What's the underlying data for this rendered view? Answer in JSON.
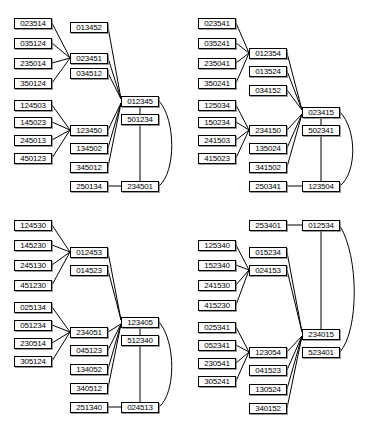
{
  "figure": {
    "type": "permutation-lattice-diagram",
    "panel_count": 4,
    "stroke_color": "#000000",
    "node_fill": "#ffffff",
    "node_text_color": "#000000"
  },
  "panels": [
    {
      "id": "panel-top-left",
      "nodes": [
        {
          "id": "tl-n0",
          "label": "023514",
          "x": 14,
          "y": 18
        },
        {
          "id": "tl-n1",
          "label": "035124",
          "x": 14,
          "y": 38
        },
        {
          "id": "tl-n2",
          "label": "235014",
          "x": 14,
          "y": 58
        },
        {
          "id": "tl-n3",
          "label": "350124",
          "x": 14,
          "y": 78
        },
        {
          "id": "tl-n4",
          "label": "124503",
          "x": 14,
          "y": 100
        },
        {
          "id": "tl-n5",
          "label": "145023",
          "x": 14,
          "y": 117
        },
        {
          "id": "tl-n6",
          "label": "245013",
          "x": 14,
          "y": 135
        },
        {
          "id": "tl-n7",
          "label": "450123",
          "x": 14,
          "y": 153
        },
        {
          "id": "tl-n8",
          "label": "013452",
          "x": 70,
          "y": 22
        },
        {
          "id": "tl-n9",
          "label": "023451",
          "x": 70,
          "y": 53
        },
        {
          "id": "tl-n10",
          "label": "034512",
          "x": 70,
          "y": 68
        },
        {
          "id": "tl-n11",
          "label": "123450",
          "x": 70,
          "y": 125
        },
        {
          "id": "tl-n12",
          "label": "134502",
          "x": 70,
          "y": 143
        },
        {
          "id": "tl-n13",
          "label": "345012",
          "x": 70,
          "y": 162
        },
        {
          "id": "tl-n14",
          "label": "250134",
          "x": 70,
          "y": 181
        },
        {
          "id": "tl-n15",
          "label": "012345",
          "x": 121,
          "y": 96
        },
        {
          "id": "tl-n16",
          "label": "501234",
          "x": 121,
          "y": 114
        },
        {
          "id": "tl-n17",
          "label": "234501",
          "x": 121,
          "y": 181
        }
      ]
    },
    {
      "id": "panel-top-right",
      "nodes": [
        {
          "id": "tr-n0",
          "label": "023541",
          "x": 14,
          "y": 18
        },
        {
          "id": "tr-n1",
          "label": "035241",
          "x": 14,
          "y": 38
        },
        {
          "id": "tr-n2",
          "label": "235041",
          "x": 14,
          "y": 58
        },
        {
          "id": "tr-n3",
          "label": "350241",
          "x": 14,
          "y": 78
        },
        {
          "id": "tr-n4",
          "label": "125034",
          "x": 14,
          "y": 100
        },
        {
          "id": "tr-n5",
          "label": "150234",
          "x": 14,
          "y": 117
        },
        {
          "id": "tr-n6",
          "label": "241503",
          "x": 14,
          "y": 135
        },
        {
          "id": "tr-n7",
          "label": "415023",
          "x": 14,
          "y": 153
        },
        {
          "id": "tr-n8",
          "label": "012354",
          "x": 65,
          "y": 48
        },
        {
          "id": "tr-n9",
          "label": "013524",
          "x": 65,
          "y": 66
        },
        {
          "id": "tr-n10",
          "label": "034152",
          "x": 65,
          "y": 85
        },
        {
          "id": "tr-n11",
          "label": "234150",
          "x": 65,
          "y": 125
        },
        {
          "id": "tr-n12",
          "label": "135024",
          "x": 65,
          "y": 143
        },
        {
          "id": "tr-n13",
          "label": "341502",
          "x": 65,
          "y": 162
        },
        {
          "id": "tr-n14",
          "label": "250341",
          "x": 65,
          "y": 181
        },
        {
          "id": "tr-n15",
          "label": "023415",
          "x": 118,
          "y": 107
        },
        {
          "id": "tr-n16",
          "label": "502341",
          "x": 118,
          "y": 125
        },
        {
          "id": "tr-n17",
          "label": "123504",
          "x": 118,
          "y": 181
        }
      ]
    },
    {
      "id": "panel-bottom-left",
      "nodes": [
        {
          "id": "bl-n0",
          "label": "124530",
          "x": 14,
          "y": 8
        },
        {
          "id": "bl-n1",
          "label": "145230",
          "x": 14,
          "y": 28
        },
        {
          "id": "bl-n2",
          "label": "245130",
          "x": 14,
          "y": 48
        },
        {
          "id": "bl-n3",
          "label": "451230",
          "x": 14,
          "y": 68
        },
        {
          "id": "bl-n4",
          "label": "025134",
          "x": 14,
          "y": 90
        },
        {
          "id": "bl-n5",
          "label": "051234",
          "x": 14,
          "y": 108
        },
        {
          "id": "bl-n6",
          "label": "230514",
          "x": 14,
          "y": 126
        },
        {
          "id": "bl-n7",
          "label": "305124",
          "x": 14,
          "y": 144
        },
        {
          "id": "bl-n8",
          "label": "012453",
          "x": 70,
          "y": 35
        },
        {
          "id": "bl-n9",
          "label": "014523",
          "x": 70,
          "y": 53
        },
        {
          "id": "bl-n10",
          "label": "234051",
          "x": 70,
          "y": 115
        },
        {
          "id": "bl-n11",
          "label": "045123",
          "x": 70,
          "y": 133
        },
        {
          "id": "bl-n12",
          "label": "134052",
          "x": 70,
          "y": 152
        },
        {
          "id": "bl-n13",
          "label": "340512",
          "x": 70,
          "y": 171
        },
        {
          "id": "bl-n14",
          "label": "251340",
          "x": 70,
          "y": 190
        },
        {
          "id": "bl-n15",
          "label": "123405",
          "x": 121,
          "y": 105
        },
        {
          "id": "bl-n16",
          "label": "512340",
          "x": 121,
          "y": 123
        },
        {
          "id": "bl-n17",
          "label": "024513",
          "x": 121,
          "y": 190
        }
      ]
    },
    {
      "id": "panel-bottom-right",
      "nodes": [
        {
          "id": "br-n0",
          "label": "125340",
          "x": 14,
          "y": 28
        },
        {
          "id": "br-n1",
          "label": "152340",
          "x": 14,
          "y": 48
        },
        {
          "id": "br-n2",
          "label": "241530",
          "x": 14,
          "y": 68
        },
        {
          "id": "br-n3",
          "label": "415230",
          "x": 14,
          "y": 88
        },
        {
          "id": "br-n4",
          "label": "025341",
          "x": 14,
          "y": 110
        },
        {
          "id": "br-n5",
          "label": "052341",
          "x": 14,
          "y": 128
        },
        {
          "id": "br-n6",
          "label": "230541",
          "x": 14,
          "y": 146
        },
        {
          "id": "br-n7",
          "label": "305241",
          "x": 14,
          "y": 164
        },
        {
          "id": "br-n8",
          "label": "253401",
          "x": 65,
          "y": 8
        },
        {
          "id": "br-n9",
          "label": "015234",
          "x": 65,
          "y": 35
        },
        {
          "id": "br-n10",
          "label": "024153",
          "x": 65,
          "y": 53
        },
        {
          "id": "br-n11",
          "label": "123054",
          "x": 65,
          "y": 135
        },
        {
          "id": "br-n12",
          "label": "041523",
          "x": 65,
          "y": 153
        },
        {
          "id": "br-n13",
          "label": "130524",
          "x": 65,
          "y": 172
        },
        {
          "id": "br-n14",
          "label": "340152",
          "x": 65,
          "y": 191
        },
        {
          "id": "br-n15",
          "label": "012534",
          "x": 118,
          "y": 8
        },
        {
          "id": "br-n16",
          "label": "234015",
          "x": 118,
          "y": 117
        },
        {
          "id": "br-n17",
          "label": "523401",
          "x": 118,
          "y": 135
        }
      ]
    }
  ]
}
